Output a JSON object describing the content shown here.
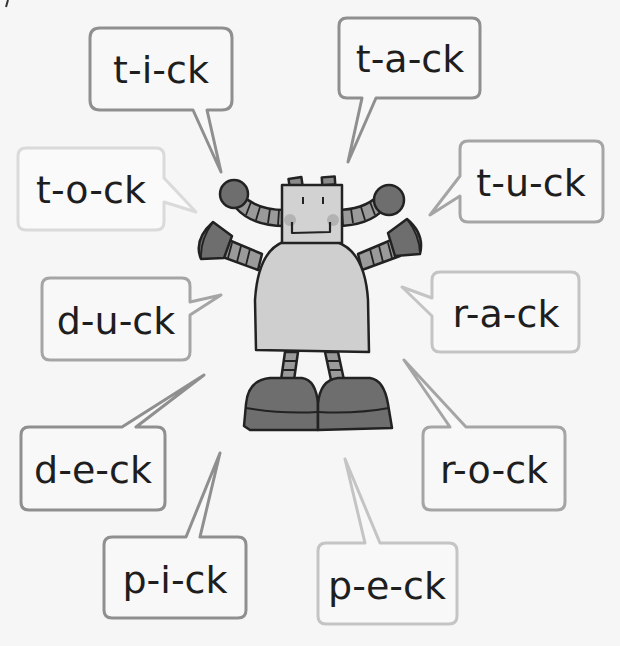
{
  "colors": {
    "background": "#f6f6f6",
    "text": "#1e1e1e",
    "border_dark": "#8f8f8f",
    "border_mid": "#a5a5a5",
    "border_light": "#c4c4c4",
    "border_faint": "#dadada",
    "robot_outline": "#222222",
    "robot_light": "#cfcfcf",
    "robot_mid": "#9a9a9a",
    "robot_dark": "#6e6e6e",
    "robot_cheek": "#b3b3b3"
  },
  "bubbles": [
    {
      "id": "tick",
      "word": "t-i-ck",
      "shade": "dark"
    },
    {
      "id": "tack",
      "word": "t-a-ck",
      "shade": "dark"
    },
    {
      "id": "tock",
      "word": "t-o-ck",
      "shade": "faint"
    },
    {
      "id": "tuck",
      "word": "t-u-ck",
      "shade": "mid"
    },
    {
      "id": "duck",
      "word": "d-u-ck",
      "shade": "mid"
    },
    {
      "id": "rack",
      "word": "r-a-ck",
      "shade": "light"
    },
    {
      "id": "deck",
      "word": "d-e-ck",
      "shade": "dark"
    },
    {
      "id": "rock",
      "word": "r-o-ck",
      "shade": "mid"
    },
    {
      "id": "pick",
      "word": "p-i-ck",
      "shade": "dark"
    },
    {
      "id": "peck",
      "word": "p-e-ck",
      "shade": "light"
    }
  ],
  "character": {
    "name": "robot"
  }
}
